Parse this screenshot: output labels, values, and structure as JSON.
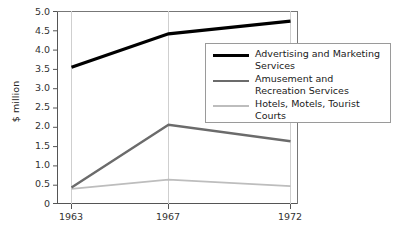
{
  "chart_data": {
    "type": "line",
    "title": "",
    "xlabel": "",
    "ylabel": "$ million",
    "x": [
      "1963",
      "1967",
      "1972"
    ],
    "categories": [
      "1963",
      "1967",
      "1972"
    ],
    "ylim": [
      0,
      5.0
    ],
    "yticks": [
      "5.0",
      "4.5",
      "4.0",
      "3.5",
      "3.0",
      "2.5",
      "2.0",
      "1.5",
      "1.0",
      "0.5",
      "0"
    ],
    "ytick_values": [
      5.0,
      4.5,
      4.0,
      3.5,
      3.0,
      2.5,
      2.0,
      1.5,
      1.0,
      0.5,
      0
    ],
    "grid": "vertical-only",
    "legend_position": "inside-right",
    "series": [
      {
        "name": "Advertising and Marketing Services",
        "values": [
          3.55,
          4.42,
          4.75
        ],
        "color": "#000000",
        "width": 3.2
      },
      {
        "name": "Amusement and Recreation Services",
        "values": [
          0.42,
          2.05,
          1.62
        ],
        "color": "#6b6b6b",
        "width": 2.4
      },
      {
        "name": "Hotels, Motels, Tourist Courts",
        "values": [
          0.38,
          0.62,
          0.45
        ],
        "color": "#bdbdbd",
        "width": 1.8
      }
    ]
  },
  "axis": {
    "y_label": "$ million",
    "y_ticks": [
      "5.0",
      "4.5",
      "4.0",
      "3.5",
      "3.0",
      "2.5",
      "2.0",
      "1.5",
      "1.0",
      "0.5",
      "0"
    ],
    "x_ticks": [
      "1963",
      "1967",
      "1972"
    ]
  },
  "legend": {
    "entries": [
      {
        "label": "Advertising and Marketing Services"
      },
      {
        "label": "Amusement and Recreation Services"
      },
      {
        "label": "Hotels, Motels, Tourist Courts"
      }
    ]
  }
}
